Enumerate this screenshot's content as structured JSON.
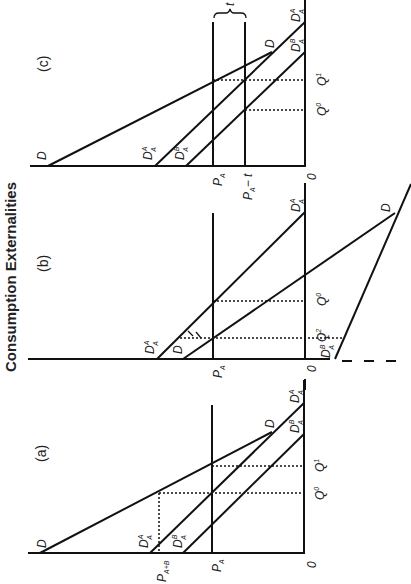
{
  "title": "Consumption Externalities",
  "orientation": "rotated 90deg clockwise",
  "panels": [
    {
      "id": "a",
      "label": "(a)",
      "curves": [
        "D",
        "D_A^A",
        "D_A^B"
      ],
      "price_labels": [
        "P_A+B",
        "P_A",
        "0"
      ],
      "quantity_labels": [
        "Q^0",
        "Q^1"
      ],
      "text": {
        "panel": "(a)",
        "D": "D",
        "DA": "D",
        "DAsup": "A",
        "DAsub": "A",
        "DB": "D",
        "DBsup": "B",
        "DBsub": "A",
        "PAB": "P",
        "PABsub": "A+B",
        "PA": "P",
        "PAsub": "A",
        "zero": "0",
        "Q0": "Q",
        "Q0sup": "0",
        "Q1": "Q",
        "Q1sup": "1"
      }
    },
    {
      "id": "b",
      "label": "(b)",
      "curves": [
        "D",
        "D_A^A",
        "D_A^B"
      ],
      "price_labels": [
        "P_A",
        "0"
      ],
      "quantity_labels": [
        "Q^2",
        "Q^0"
      ],
      "text": {
        "panel": "(b)",
        "D": "D",
        "DA": "D",
        "DAsup": "A",
        "DAsub": "A",
        "DB": "D",
        "DBsup": "B",
        "DBsub": "A",
        "PA": "P",
        "PAsub": "A",
        "zero": "0",
        "Q0": "Q",
        "Q0sup": "0",
        "Q2": "Q",
        "Q2sup": "2"
      }
    },
    {
      "id": "c",
      "label": "(c)",
      "curves": [
        "D",
        "D_A^A",
        "D_A^B"
      ],
      "price_labels": [
        "P_A",
        "P_A - t",
        "0"
      ],
      "quantity_labels": [
        "Q^0",
        "Q^1"
      ],
      "tax_label": "t",
      "text": {
        "panel": "(c)",
        "D": "D",
        "DA": "D",
        "DAsup": "A",
        "DAsub": "A",
        "DB": "D",
        "DBsup": "B",
        "DBsub": "A",
        "PA": "P",
        "PAsub": "A",
        "PAt": "P",
        "PAtsub": "A",
        "PAtminus": "− t",
        "zero": "0",
        "Q0": "Q",
        "Q0sup": "0",
        "Q1": "Q",
        "Q1sup": "1",
        "t": "t"
      }
    }
  ]
}
